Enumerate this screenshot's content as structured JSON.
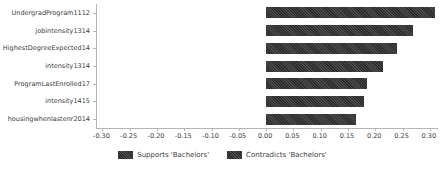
{
  "chart_data": {
    "type": "bar",
    "orientation": "horizontal",
    "title": "",
    "xlabel": "",
    "ylabel": "",
    "categories": [
      "UndergradProgram1112",
      "jobintensity1314",
      "HighestDegreeExpected14",
      "intensity1314",
      "ProgramLastEnrolled17",
      "intensity1415",
      "housingwhenlastenr2014"
    ],
    "values": [
      0.31,
      0.27,
      0.24,
      0.215,
      0.185,
      0.18,
      0.165
    ],
    "series_of_each_bar": "Supports 'Bachelors'",
    "xlim": [
      -0.31,
      0.315
    ],
    "xtick_labels": [
      "-0.30",
      "-0.25",
      "-0.20",
      "-0.15",
      "-0.10",
      "-0.05",
      "0.00",
      "0.05",
      "0.10",
      "0.15",
      "0.20",
      "0.25",
      "0.30"
    ],
    "xtick_values": [
      -0.3,
      -0.25,
      -0.2,
      -0.15,
      -0.1,
      -0.05,
      0.0,
      0.05,
      0.1,
      0.15,
      0.2,
      0.25,
      0.3
    ],
    "grid": false,
    "legend_position": "bottom-center",
    "bar_color": "#3a3a3a",
    "legend": [
      {
        "label": "Supports 'Bachelors'",
        "color": "#303030"
      },
      {
        "label": "Contradicts 'Bachelors'",
        "color": "#474747"
      }
    ]
  }
}
